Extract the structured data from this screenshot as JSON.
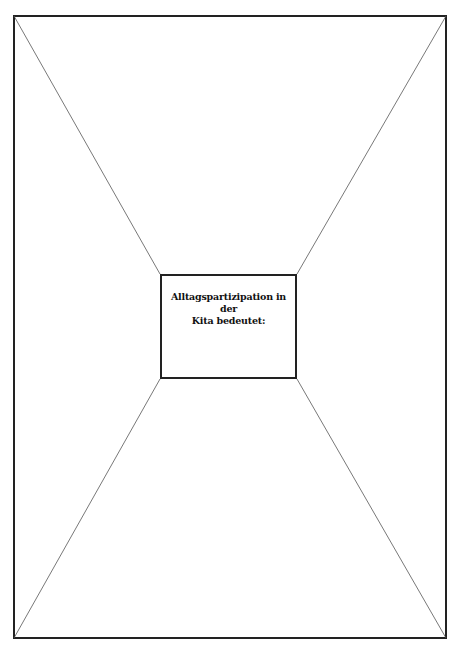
{
  "worksheet": {
    "center_prompt_line1": "Alltagspartizipation in der",
    "center_prompt_line2": "Kita bedeutet:"
  },
  "colors": {
    "frame": "#222222",
    "diagonals": "#555555",
    "background": "#ffffff"
  }
}
